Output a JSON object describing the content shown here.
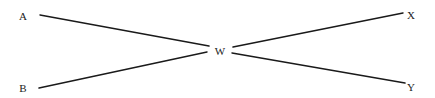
{
  "diagram": {
    "type": "graph",
    "nodes": [
      {
        "id": "A",
        "label": "A",
        "x": 23,
        "y": 20
      },
      {
        "id": "B",
        "label": "B",
        "x": 23,
        "y": 92
      },
      {
        "id": "W",
        "label": "W",
        "x": 220,
        "y": 55
      },
      {
        "id": "X",
        "label": "X",
        "x": 411,
        "y": 19
      },
      {
        "id": "Y",
        "label": "Y",
        "x": 411,
        "y": 91
      }
    ],
    "edges": [
      {
        "from": "A",
        "to": "W",
        "x1": 40,
        "y1": 15,
        "x2": 209,
        "y2": 46
      },
      {
        "from": "B",
        "to": "W",
        "x1": 39,
        "y1": 88,
        "x2": 207,
        "y2": 52
      },
      {
        "from": "W",
        "to": "X",
        "x1": 233,
        "y1": 47,
        "x2": 403,
        "y2": 13
      },
      {
        "from": "W",
        "to": "Y",
        "x1": 232,
        "y1": 53,
        "x2": 405,
        "y2": 83
      }
    ],
    "colors": {
      "line": "#1a1a1a",
      "text": "#222222",
      "background": "#ffffff"
    }
  }
}
